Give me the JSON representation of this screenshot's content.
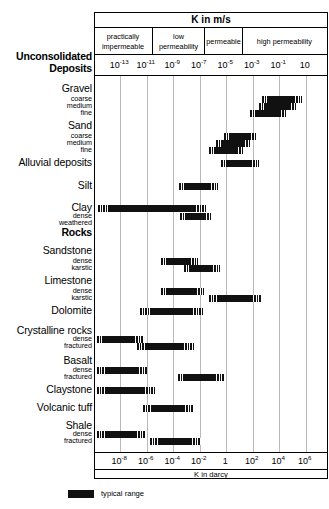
{
  "chart_data": {
    "type": "bar",
    "title": "K in m/s",
    "xlabel_top": "K in m/s",
    "xlabel_bottom": "K in darcy",
    "grid": true,
    "legend_position": "below-left",
    "axis_top": {
      "label": "K in m/s",
      "ticks": [
        {
          "mantissa": "10",
          "exp": "-13"
        },
        {
          "mantissa": "10",
          "exp": "-11"
        },
        {
          "mantissa": "10",
          "exp": "-9"
        },
        {
          "mantissa": "10",
          "exp": "-7"
        },
        {
          "mantissa": "10",
          "exp": "-5"
        },
        {
          "mantissa": "10",
          "exp": "-3"
        },
        {
          "mantissa": "10",
          "exp": "-1"
        },
        {
          "mantissa": "10",
          "exp": ""
        }
      ],
      "range_exp": [
        -14,
        2
      ]
    },
    "axis_bottom": {
      "label": "K in darcy",
      "ticks": [
        {
          "mantissa": "10",
          "exp": "-8"
        },
        {
          "mantissa": "10",
          "exp": "-6"
        },
        {
          "mantissa": "10",
          "exp": "-4"
        },
        {
          "mantissa": "10",
          "exp": "-2"
        },
        {
          "mantissa": "1",
          "exp": ""
        },
        {
          "mantissa": "10",
          "exp": "2"
        },
        {
          "mantissa": "10",
          "exp": "4"
        },
        {
          "mantissa": "10",
          "exp": "6"
        }
      ]
    },
    "permeability_classes": [
      {
        "label": "practically impermeable",
        "start_exp": -14,
        "end_exp": -10
      },
      {
        "label": "low permeability",
        "start_exp": -10,
        "end_exp": -6.4
      },
      {
        "label": "permeable",
        "start_exp": -6.4,
        "end_exp": -3.8
      },
      {
        "label": "high permeability",
        "start_exp": -3.8,
        "end_exp": 2
      }
    ],
    "group_headings": [
      {
        "label": "Unconsolidated Deposits",
        "y": 57
      },
      {
        "label": "Rocks",
        "y": 233
      }
    ],
    "rows": [
      {
        "name": "Gravel",
        "level": "major",
        "y": 89,
        "bar": null
      },
      {
        "name": "coarse",
        "level": "sub",
        "y": 99,
        "bar": {
          "start_exp": -2.55,
          "end_exp": 0.3
        }
      },
      {
        "name": "medium",
        "level": "sub",
        "y": 106,
        "bar": {
          "start_exp": -2.75,
          "end_exp": -0.05
        }
      },
      {
        "name": "fine",
        "level": "sub",
        "y": 113,
        "bar": {
          "start_exp": -3.35,
          "end_exp": -0.75
        }
      },
      {
        "name": "Sand",
        "level": "major",
        "y": 126,
        "bar": null
      },
      {
        "name": "coarse",
        "level": "sub",
        "y": 136,
        "bar": {
          "start_exp": -5.15,
          "end_exp": -2.85
        }
      },
      {
        "name": "medium",
        "level": "sub",
        "y": 143,
        "bar": {
          "start_exp": -5.7,
          "end_exp": -3.25
        }
      },
      {
        "name": "fine",
        "level": "sub",
        "y": 150,
        "bar": {
          "start_exp": -6.2,
          "end_exp": -3.75
        }
      },
      {
        "name": "Alluvial deposits",
        "level": "major",
        "y": 163,
        "bar": {
          "start_exp": -5.4,
          "end_exp": -2.7
        }
      },
      {
        "name": "Silt",
        "level": "major",
        "y": 186,
        "bar": {
          "start_exp": -8.25,
          "end_exp": -5.55
        }
      },
      {
        "name": "Clay",
        "level": "major",
        "y": 208,
        "bar": {
          "start_exp": -13.85,
          "end_exp": -6.3
        }
      },
      {
        "name": "dense",
        "level": "sub",
        "y": 216,
        "bar": {
          "start_exp": -8.2,
          "end_exp": -6.0
        }
      },
      {
        "name": "weathered",
        "level": "sub",
        "y": 223,
        "bar": null
      },
      {
        "name": "Rocks",
        "level": "bold",
        "y": 233,
        "bar": null
      },
      {
        "name": "Sandstone",
        "level": "major",
        "y": 251,
        "bar": null
      },
      {
        "name": "dense",
        "level": "sub",
        "y": 261,
        "bar": {
          "start_exp": -9.55,
          "end_exp": -6.9
        }
      },
      {
        "name": "karstic",
        "level": "sub",
        "y": 268,
        "bar": {
          "start_exp": -7.95,
          "end_exp": -5.4
        }
      },
      {
        "name": "Limestone",
        "level": "major",
        "y": 281,
        "bar": null
      },
      {
        "name": "dense",
        "level": "sub",
        "y": 291,
        "bar": {
          "start_exp": -9.5,
          "end_exp": -6.45
        }
      },
      {
        "name": "karstic",
        "level": "sub",
        "y": 298,
        "bar": {
          "start_exp": -6.2,
          "end_exp": -2.45
        }
      },
      {
        "name": "Dolomite",
        "level": "major",
        "y": 311,
        "bar": {
          "start_exp": -10.95,
          "end_exp": -6.5
        }
      },
      {
        "name": "Crystalline rocks",
        "level": "major",
        "y": 331,
        "bar": null
      },
      {
        "name": "dense",
        "level": "sub",
        "y": 339,
        "bar": {
          "start_exp": -13.9,
          "end_exp": -10.7
        }
      },
      {
        "name": "fractured",
        "level": "sub",
        "y": 346,
        "bar": {
          "start_exp": -11.15,
          "end_exp": -7.2
        }
      },
      {
        "name": "Basalt",
        "level": "major",
        "y": 361,
        "bar": null
      },
      {
        "name": "dense",
        "level": "sub",
        "y": 370,
        "bar": {
          "start_exp": -13.9,
          "end_exp": -10.4
        }
      },
      {
        "name": "fractured",
        "level": "sub",
        "y": 377,
        "bar": {
          "start_exp": -8.35,
          "end_exp": -5.1
        }
      },
      {
        "name": "Claystone",
        "level": "major",
        "y": 390,
        "bar": {
          "start_exp": -13.9,
          "end_exp": -9.85
        }
      },
      {
        "name": "Volcanic tuff",
        "level": "major",
        "y": 408,
        "bar": {
          "start_exp": -10.75,
          "end_exp": -7.15
        }
      },
      {
        "name": "Shale",
        "level": "major",
        "y": 426,
        "bar": null
      },
      {
        "name": "dense",
        "level": "sub",
        "y": 434,
        "bar": {
          "start_exp": -13.9,
          "end_exp": -10.55
        }
      },
      {
        "name": "fractured",
        "level": "sub",
        "y": 441,
        "bar": {
          "start_exp": -10.3,
          "end_exp": -6.7
        }
      }
    ]
  },
  "legend": {
    "label": "typical range",
    "swatch_color": "#111111"
  },
  "colors": {
    "bar": "#111111",
    "grid": "#b9b9b9",
    "border": "#000000",
    "background": "#ffffff"
  }
}
